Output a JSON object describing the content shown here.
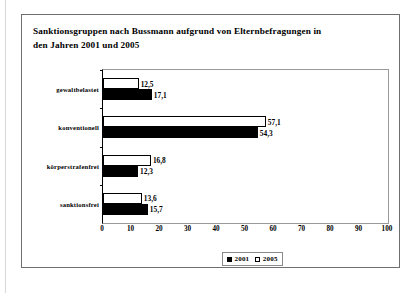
{
  "chart_data": {
    "type": "bar",
    "orientation": "horizontal",
    "title": "Sanktionsgruppen nach Bussmann aufgrund von Elternbefragungen in den Jahren 2001 und 2005",
    "title_lines": [
      "Sanktionsgruppen nach Bussmann aufgrund von Elternbefragungen in",
      "den Jahren 2001 und 2005"
    ],
    "categories": [
      "gewaltbelastet",
      "konventionell",
      "körperstrafenfrei",
      "sanktionsfrei"
    ],
    "series": [
      {
        "name": "2001",
        "color": "#000000",
        "style": "filled",
        "values": [
          17.1,
          54.3,
          12.3,
          15.7
        ],
        "labels": [
          "17,1",
          "54,3",
          "12,3",
          "15,7"
        ]
      },
      {
        "name": "2005",
        "color": "#ffffff",
        "style": "hollow",
        "values": [
          12.5,
          57.1,
          16.8,
          13.6
        ],
        "labels": [
          "12,5",
          "57,1",
          "16,8",
          "13,6"
        ]
      }
    ],
    "xlabel": "",
    "ylabel": "",
    "xlim": [
      0,
      100
    ],
    "xticks": [
      0,
      10,
      20,
      30,
      40,
      50,
      60,
      70,
      80,
      90,
      100
    ],
    "xtick_labels": [
      "0",
      "10",
      "20",
      "30",
      "40",
      "50",
      "60",
      "70",
      "80",
      "90",
      "100"
    ],
    "grid": false,
    "legend_position": "bottom-center",
    "legend": [
      {
        "label": "2001",
        "swatch": "filled"
      },
      {
        "label": "2005",
        "swatch": "hollow"
      }
    ]
  }
}
